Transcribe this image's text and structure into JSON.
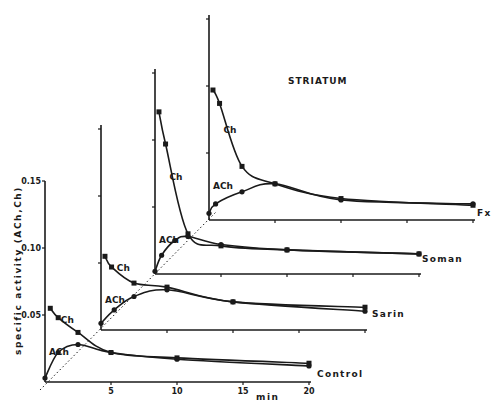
{
  "chart_data": {
    "type": "line",
    "title": "STRIATUM",
    "xlabel": "min",
    "ylabel": "specific activity (ACh,Ch)",
    "x_ticks": [
      5,
      10,
      15,
      20
    ],
    "y_ticks": [
      "0.05",
      "0.10",
      "0.15"
    ],
    "xlim": [
      0,
      20
    ],
    "ylim": [
      0,
      0.15
    ],
    "layout": "staggered 3D-offset panels, each panel shifted up and right",
    "grid": false,
    "reference_line": "dotted diagonal through panel origins",
    "panels": [
      {
        "name": "Control",
        "series": [
          {
            "name": "Ch",
            "marker": "square",
            "x": [
              0.4,
              1.0,
              2.5,
              5,
              10,
              20
            ],
            "y": [
              0.055,
              0.048,
              0.037,
              0.022,
              0.018,
              0.014
            ]
          },
          {
            "name": "ACh",
            "marker": "circle",
            "x": [
              0,
              1.0,
              2.5,
              5,
              10,
              20
            ],
            "y": [
              0.003,
              0.022,
              0.028,
              0.022,
              0.017,
              0.012
            ]
          }
        ]
      },
      {
        "name": "Sarin",
        "series": [
          {
            "name": "Ch",
            "marker": "square",
            "x": [
              0.3,
              0.8,
              2.5,
              5,
              10,
              20
            ],
            "y": [
              0.055,
              0.047,
              0.035,
              0.032,
              0.021,
              0.017
            ]
          },
          {
            "name": "ACh",
            "marker": "circle",
            "x": [
              0,
              1.0,
              2.5,
              5,
              10,
              20
            ],
            "y": [
              0.005,
              0.015,
              0.025,
              0.03,
              0.021,
              0.014
            ]
          }
        ]
      },
      {
        "name": "Soman",
        "series": [
          {
            "name": "Ch",
            "marker": "square",
            "x": [
              0.3,
              0.8,
              2.5,
              5,
              10,
              20
            ],
            "y": [
              0.121,
              0.097,
              0.03,
              0.021,
              0.018,
              0.015
            ]
          },
          {
            "name": "ACh",
            "marker": "circle",
            "x": [
              0,
              0.5,
              1.5,
              2.5,
              5,
              10,
              20
            ],
            "y": [
              0.002,
              0.014,
              0.025,
              0.028,
              0.022,
              0.018,
              0.015
            ]
          }
        ]
      },
      {
        "name": "Fx",
        "series": [
          {
            "name": "Ch",
            "marker": "square",
            "x": [
              0.3,
              0.8,
              2.5,
              5,
              10,
              20
            ],
            "y": [
              0.097,
              0.087,
              0.04,
              0.027,
              0.016,
              0.011
            ]
          },
          {
            "name": "ACh",
            "marker": "circle",
            "x": [
              0,
              0.5,
              2.5,
              5,
              10,
              20
            ],
            "y": [
              0.005,
              0.012,
              0.021,
              0.027,
              0.015,
              0.012
            ]
          }
        ]
      }
    ]
  },
  "labels": {
    "title": "STRIATUM",
    "ylabel": "specific activity (ACh,Ch)",
    "xunit": "min",
    "ch": "Ch",
    "ach": "ACh",
    "panels": [
      "Control",
      "Sarin",
      "Soman",
      "Fx"
    ],
    "y_ticks": [
      "0.05",
      "0.10",
      "0.15"
    ],
    "x_ticks": [
      "5",
      "10",
      "15",
      "20"
    ]
  },
  "colors": {
    "ink": "#1a1a1a",
    "background": "#ffffff"
  }
}
